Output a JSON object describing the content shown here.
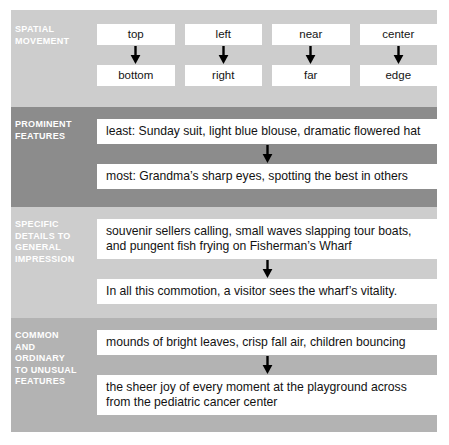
{
  "figure": {
    "colors": {
      "band_light": "#cdcdcd",
      "band_dark": "#8c8c8c",
      "band_medium": "#b3b3b3",
      "box_background": "#ffffff",
      "label_text": "#ffffff",
      "body_text": "#121212",
      "arrow": "#000000"
    }
  },
  "sections": [
    {
      "id": "spatial-movement",
      "label_lines": [
        "SPATIAL",
        "MOVEMENT"
      ],
      "shade": "light",
      "layout": "columns",
      "columns": [
        {
          "from": "top",
          "arrow": "down-arrow-icon",
          "to": "bottom"
        },
        {
          "from": "left",
          "arrow": "down-arrow-icon",
          "to": "right"
        },
        {
          "from": "near",
          "arrow": "down-arrow-icon",
          "to": "far"
        },
        {
          "from": "center",
          "arrow": "down-arrow-icon",
          "to": "edge"
        }
      ]
    },
    {
      "id": "prominent-features",
      "label_lines": [
        "PROMINENT",
        "FEATURES"
      ],
      "shade": "dark",
      "layout": "stacked",
      "from_lines": [
        "least: Sunday suit, light blue blouse, dramatic flowered hat"
      ],
      "arrow": "down-arrow-icon",
      "to_lines": [
        "most: Grandma’s sharp eyes, spotting the best in others"
      ]
    },
    {
      "id": "specific-details-to-general-impression",
      "label_lines": [
        "SPECIFIC",
        "DETAILS TO",
        "GENERAL",
        "IMPRESSION"
      ],
      "shade": "light",
      "layout": "stacked",
      "from_lines": [
        "souvenir sellers calling, small waves slapping tour boats,",
        "and pungent fish frying on Fisherman’s Wharf"
      ],
      "arrow": "down-arrow-icon",
      "to_lines": [
        "In all this commotion, a visitor sees the wharf’s vitality."
      ]
    },
    {
      "id": "common-and-ordinary-to-unusual-features",
      "label_lines": [
        "COMMON",
        "AND",
        "ORDINARY",
        "TO UNUSUAL",
        "FEATURES"
      ],
      "shade": "medium",
      "layout": "stacked",
      "from_lines": [
        "mounds of bright leaves, crisp fall air, children bouncing"
      ],
      "arrow": "down-arrow-icon",
      "to_lines": [
        "the sheer joy of every moment at the playground across",
        "from the pediatric cancer center"
      ]
    }
  ]
}
